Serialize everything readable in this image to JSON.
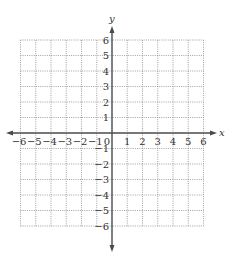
{
  "chart_data": {
    "type": "scatter",
    "title": "",
    "xlabel": "x",
    "ylabel": "y",
    "xlim": [
      -6,
      6
    ],
    "ylim": [
      -6,
      6
    ],
    "grid": true,
    "grid_style": "dotted",
    "x_ticks": [
      -6,
      -5,
      -4,
      -3,
      -2,
      -1,
      0,
      1,
      2,
      3,
      4,
      5,
      6
    ],
    "y_ticks": [
      -6,
      -5,
      -4,
      -3,
      -2,
      -1,
      1,
      2,
      3,
      4,
      5,
      6
    ],
    "x_tick_labels": [
      "−6",
      "−5",
      "−4",
      "−3",
      "−2",
      "−1",
      "0",
      "1",
      "2",
      "3",
      "4",
      "5",
      "6"
    ],
    "y_tick_labels": [
      "−6",
      "−5",
      "−4",
      "−3",
      "−2",
      "−1",
      "1",
      "2",
      "3",
      "4",
      "5",
      "6"
    ],
    "origin_label": "0",
    "series": [],
    "legend": null
  },
  "colors": {
    "axis": "#4a4a4a",
    "grid": "#8a8a8a",
    "text": "#333333",
    "background": "#ffffff"
  }
}
